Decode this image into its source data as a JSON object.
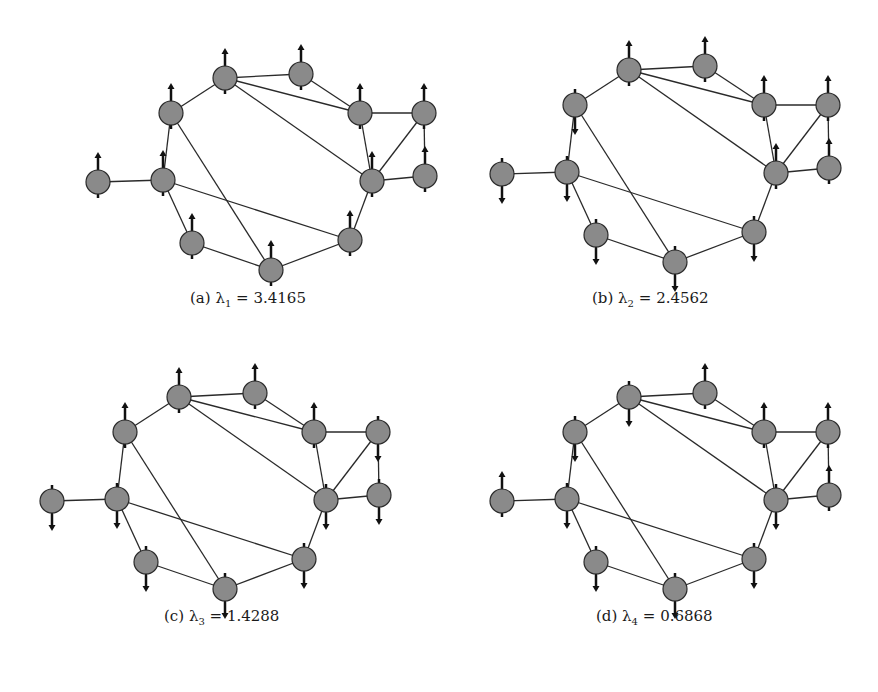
{
  "figure": {
    "style": {
      "node_fill": "#8a8a8a",
      "node_stroke": "#2a2a2a",
      "edge_color": "#2a2a2a",
      "arrow_color": "#111111",
      "node_radius": 12
    },
    "graph": {
      "nodes": [
        {
          "id": 0,
          "x": 98,
          "y": 182
        },
        {
          "id": 1,
          "x": 163,
          "y": 180
        },
        {
          "id": 2,
          "x": 171,
          "y": 113
        },
        {
          "id": 3,
          "x": 225,
          "y": 78
        },
        {
          "id": 4,
          "x": 301,
          "y": 74
        },
        {
          "id": 5,
          "x": 360,
          "y": 113
        },
        {
          "id": 6,
          "x": 424,
          "y": 113
        },
        {
          "id": 7,
          "x": 372,
          "y": 181
        },
        {
          "id": 8,
          "x": 425,
          "y": 176
        },
        {
          "id": 9,
          "x": 350,
          "y": 240
        },
        {
          "id": 10,
          "x": 271,
          "y": 270
        },
        {
          "id": 11,
          "x": 192,
          "y": 243
        }
      ],
      "edges": [
        [
          0,
          1
        ],
        [
          1,
          2
        ],
        [
          2,
          3
        ],
        [
          3,
          4
        ],
        [
          3,
          5
        ],
        [
          3,
          7
        ],
        [
          4,
          5
        ],
        [
          5,
          6
        ],
        [
          5,
          7
        ],
        [
          6,
          7
        ],
        [
          6,
          8
        ],
        [
          7,
          8
        ],
        [
          7,
          9
        ],
        [
          9,
          10
        ],
        [
          10,
          11
        ],
        [
          11,
          1
        ],
        [
          1,
          9
        ],
        [
          2,
          10
        ]
      ]
    },
    "panels": [
      {
        "label": "(a)",
        "lambda_symbol": "λ",
        "lambda_index": "1",
        "equals": "=",
        "value": "3.4165",
        "offset": [
          0,
          0
        ],
        "caption_pos": [
          190,
          289
        ],
        "spins": [
          "up",
          "up",
          "up",
          "up",
          "up",
          "up",
          "up",
          "up",
          "up",
          "up",
          "up",
          "up"
        ]
      },
      {
        "label": "(b)",
        "lambda_symbol": "λ",
        "lambda_index": "2",
        "equals": "=",
        "value": "2.4562",
        "offset": [
          404,
          -8
        ],
        "caption_pos": [
          592,
          289
        ],
        "spins": [
          "down",
          "down",
          "down",
          "up",
          "up",
          "up",
          "up",
          "up",
          "up",
          "down",
          "down",
          "down"
        ]
      },
      {
        "label": "(c)",
        "lambda_symbol": "λ",
        "lambda_index": "3",
        "equals": "=",
        "value": "1.4288",
        "offset": [
          -46,
          319
        ],
        "caption_pos": [
          164,
          607
        ],
        "spins": [
          "down",
          "down",
          "up",
          "up",
          "up",
          "up",
          "down",
          "down",
          "down",
          "down",
          "down",
          "down"
        ]
      },
      {
        "label": "(d)",
        "lambda_symbol": "λ",
        "lambda_index": "4",
        "equals": "=",
        "value": "0.6868",
        "offset": [
          404,
          319
        ],
        "caption_pos": [
          596,
          607
        ],
        "spins": [
          "up",
          "down",
          "down",
          "down",
          "up",
          "up",
          "up",
          "down",
          "up",
          "down",
          "down",
          "down"
        ]
      }
    ]
  }
}
